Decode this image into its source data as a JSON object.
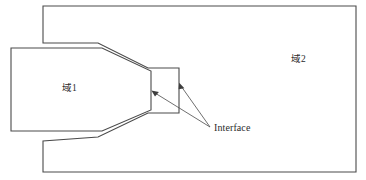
{
  "diagram": {
    "background_color": "#ffffff",
    "outline_color": "#4a4a4a",
    "leader_color": "#555555",
    "text_color": "#2b2b2b",
    "labels": {
      "domain1": "域1",
      "domain2": "域2",
      "interface": "Interface"
    },
    "regions": [
      {
        "name": "domain2-outer-region",
        "label": "域2",
        "points": "43,6 356,6 356,172 43,172 43,141 98,137 148,113 179,113 179,68 148,68 98,43 43,43"
      },
      {
        "name": "domain1-inner-region",
        "label": "域1",
        "points": "11,48 102,48 151,71 151,110 102,131 11,131"
      }
    ],
    "leaders": [
      {
        "name": "interface-leader-to-domain1-throat",
        "from": "210,127",
        "to": "153,92"
      },
      {
        "name": "interface-leader-to-outer-notch",
        "from": "210,127",
        "to": "180,85"
      }
    ]
  }
}
